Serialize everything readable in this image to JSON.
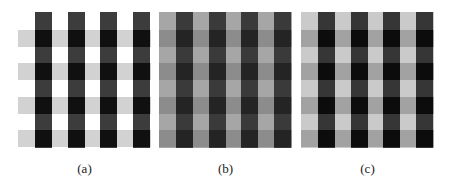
{
  "figure": {
    "panels": [
      {
        "id": "a",
        "label": "(a)",
        "x": 18,
        "width": 133,
        "colors": {
          "background": "#ffffff",
          "hband": "#d2d2d2",
          "vbar": "#3c3c3c",
          "cross": "#101010"
        }
      },
      {
        "id": "b",
        "label": "(b)",
        "x": 159,
        "width": 133,
        "colors": {
          "background": "#a6a6a6",
          "hband": "#8c8c8c",
          "vbar": "#3a3a3a",
          "cross": "#242424"
        }
      },
      {
        "id": "c",
        "label": "(c)",
        "x": 301,
        "width": 133,
        "colors": {
          "background": "#cacaca",
          "hband": "#a2a2a2",
          "vbar": "#363636",
          "cross": "#0c0c0c"
        }
      }
    ],
    "grid": {
      "vbar_offsets": [
        17,
        50,
        82,
        115
      ],
      "vbar_width": 17,
      "hband_offsets": [
        18,
        51,
        85,
        118
      ],
      "hband_height": 17,
      "panel_height": 136
    }
  }
}
